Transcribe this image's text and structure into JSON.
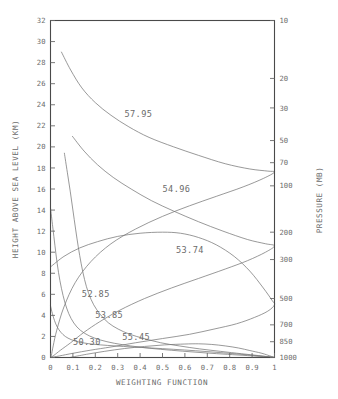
{
  "chart_data": {
    "type": "line",
    "title": "",
    "xlabel": "WEIGHTING FUNCTION",
    "ylabel": "HEIGHT ABOVE SEA LEVEL (KM)",
    "ylabel_right": "PRESSURE (MB)",
    "xlim": [
      0,
      1
    ],
    "ylim": [
      0,
      32
    ],
    "grid": false,
    "legend": "inline-curve-labels",
    "xticks": [
      0,
      0.1,
      0.2,
      0.3,
      0.4,
      0.5,
      0.6,
      0.7,
      0.8,
      0.9,
      1
    ],
    "xticklabels": [
      "0",
      "0.1",
      "0.2",
      "0.3",
      "0.4",
      "0.5",
      "0.6",
      "0.7",
      "0.8",
      "0.9",
      "1"
    ],
    "yticks": [
      0,
      2,
      4,
      6,
      8,
      10,
      12,
      14,
      16,
      18,
      20,
      22,
      24,
      26,
      28,
      30,
      32
    ],
    "yticklabels": [
      "0",
      "2",
      "4",
      "6",
      "8",
      "10",
      "12",
      "14",
      "16",
      "18",
      "20",
      "22",
      "24",
      "26",
      "28",
      "30",
      "32"
    ],
    "right_axis_scale": "log-pressure",
    "right_ticks": [
      {
        "label": "10",
        "km": 32.0
      },
      {
        "label": "20",
        "km": 26.5
      },
      {
        "label": "30",
        "km": 23.7
      },
      {
        "label": "50",
        "km": 20.6
      },
      {
        "label": "70",
        "km": 18.5
      },
      {
        "label": "100",
        "km": 16.3
      },
      {
        "label": "200",
        "km": 11.9
      },
      {
        "label": "300",
        "km": 9.3
      },
      {
        "label": "500",
        "km": 5.6
      },
      {
        "label": "700",
        "km": 3.1
      },
      {
        "label": "850",
        "km": 1.5
      },
      {
        "label": "1000",
        "km": 0.0
      }
    ],
    "series": [
      {
        "name": "57.95",
        "label": "57.95",
        "label_x": 0.33,
        "label_km": 23.1,
        "peak_km": 17.6,
        "points": [
          [
            0.049,
            29.0
          ],
          [
            0.09,
            27.3
          ],
          [
            0.14,
            25.6
          ],
          [
            0.2,
            24.2
          ],
          [
            0.27,
            23.0
          ],
          [
            0.35,
            21.9
          ],
          [
            0.44,
            20.9
          ],
          [
            0.55,
            20.0
          ],
          [
            0.66,
            19.2
          ],
          [
            0.78,
            18.4
          ],
          [
            0.89,
            17.9
          ],
          [
            0.97,
            17.7
          ],
          [
            1.0,
            17.6
          ],
          [
            0.95,
            17.0
          ],
          [
            0.86,
            16.2
          ],
          [
            0.74,
            15.3
          ],
          [
            0.62,
            14.4
          ],
          [
            0.5,
            13.4
          ],
          [
            0.38,
            12.2
          ],
          [
            0.27,
            10.8
          ],
          [
            0.18,
            9.1
          ],
          [
            0.11,
            7.1
          ],
          [
            0.06,
            4.8
          ],
          [
            0.028,
            2.6
          ],
          [
            0.012,
            1.1
          ],
          [
            0.004,
            0.2
          ],
          [
            0.0,
            0.0
          ]
        ]
      },
      {
        "name": "54.96",
        "label": "54.96",
        "label_x": 0.5,
        "label_km": 16.0,
        "peak_km": 10.6,
        "points": [
          [
            0.098,
            21.0
          ],
          [
            0.15,
            19.6
          ],
          [
            0.21,
            18.3
          ],
          [
            0.28,
            17.1
          ],
          [
            0.36,
            16.0
          ],
          [
            0.45,
            14.9
          ],
          [
            0.55,
            13.9
          ],
          [
            0.66,
            12.9
          ],
          [
            0.77,
            12.0
          ],
          [
            0.88,
            11.2
          ],
          [
            0.96,
            10.8
          ],
          [
            1.0,
            10.6
          ],
          [
            0.96,
            10.0
          ],
          [
            0.88,
            9.2
          ],
          [
            0.78,
            8.4
          ],
          [
            0.66,
            7.5
          ],
          [
            0.54,
            6.6
          ],
          [
            0.42,
            5.6
          ],
          [
            0.31,
            4.5
          ],
          [
            0.22,
            3.4
          ],
          [
            0.15,
            2.4
          ],
          [
            0.09,
            1.4
          ],
          [
            0.045,
            0.7
          ],
          [
            0.015,
            0.2
          ],
          [
            0.0,
            0.0
          ]
        ]
      },
      {
        "name": "53.74",
        "label": "53.74",
        "label_x": 0.56,
        "label_km": 10.2,
        "peak_km": 5.0,
        "points": [
          [
            0.0,
            8.6
          ],
          [
            0.06,
            9.6
          ],
          [
            0.13,
            10.4
          ],
          [
            0.21,
            11.0
          ],
          [
            0.3,
            11.5
          ],
          [
            0.4,
            11.8
          ],
          [
            0.5,
            11.9
          ],
          [
            0.58,
            11.8
          ],
          [
            0.66,
            11.4
          ],
          [
            0.74,
            10.7
          ],
          [
            0.82,
            9.6
          ],
          [
            0.89,
            8.2
          ],
          [
            0.95,
            6.6
          ],
          [
            0.99,
            5.4
          ],
          [
            1.0,
            5.0
          ],
          [
            0.97,
            4.4
          ],
          [
            0.91,
            3.8
          ],
          [
            0.83,
            3.2
          ],
          [
            0.73,
            2.7
          ],
          [
            0.62,
            2.2
          ],
          [
            0.5,
            1.8
          ],
          [
            0.38,
            1.4
          ],
          [
            0.27,
            1.0
          ],
          [
            0.18,
            0.7
          ],
          [
            0.1,
            0.4
          ],
          [
            0.04,
            0.15
          ],
          [
            0.0,
            0.0
          ]
        ]
      },
      {
        "name": "52.85",
        "label": "52.85",
        "label_x": 0.14,
        "label_km": 6.0,
        "peak_km": 0.0,
        "points": [
          [
            0.062,
            19.4
          ],
          [
            0.075,
            17.6
          ],
          [
            0.088,
            15.8
          ],
          [
            0.1,
            14.0
          ],
          [
            0.112,
            12.2
          ],
          [
            0.124,
            10.5
          ],
          [
            0.137,
            8.9
          ],
          [
            0.152,
            7.4
          ],
          [
            0.17,
            6.1
          ],
          [
            0.193,
            5.0
          ],
          [
            0.222,
            4.1
          ],
          [
            0.258,
            3.3
          ],
          [
            0.302,
            2.7
          ],
          [
            0.355,
            2.2
          ],
          [
            0.418,
            1.8
          ],
          [
            0.492,
            1.4
          ],
          [
            0.575,
            1.1
          ],
          [
            0.665,
            0.82
          ],
          [
            0.76,
            0.58
          ],
          [
            0.852,
            0.36
          ],
          [
            0.93,
            0.18
          ],
          [
            0.98,
            0.06
          ],
          [
            1.0,
            0.0
          ]
        ]
      },
      {
        "name": "53.85",
        "label": "53.85",
        "label_x": 0.2,
        "label_km": 4.0,
        "peak_km": 0.0,
        "points": [
          [
            0.0,
            14.2
          ],
          [
            0.01,
            12.4
          ],
          [
            0.02,
            10.6
          ],
          [
            0.03,
            8.9
          ],
          [
            0.042,
            7.3
          ],
          [
            0.056,
            5.9
          ],
          [
            0.072,
            4.7
          ],
          [
            0.092,
            3.7
          ],
          [
            0.118,
            2.9
          ],
          [
            0.152,
            2.3
          ],
          [
            0.196,
            1.85
          ],
          [
            0.252,
            1.5
          ],
          [
            0.32,
            1.22
          ],
          [
            0.4,
            0.98
          ],
          [
            0.49,
            0.78
          ],
          [
            0.59,
            0.6
          ],
          [
            0.69,
            0.44
          ],
          [
            0.79,
            0.3
          ],
          [
            0.88,
            0.18
          ],
          [
            0.95,
            0.08
          ],
          [
            1.0,
            0.0
          ]
        ]
      },
      {
        "name": "55.45",
        "label": "55.45",
        "label_x": 0.32,
        "label_km": 1.9,
        "peak_km": 0.0,
        "points": [
          [
            0.086,
            0.0
          ],
          [
            0.16,
            0.3
          ],
          [
            0.24,
            0.58
          ],
          [
            0.33,
            0.85
          ],
          [
            0.42,
            1.05
          ],
          [
            0.51,
            1.2
          ],
          [
            0.6,
            1.28
          ],
          [
            0.66,
            1.3
          ],
          [
            0.72,
            1.24
          ],
          [
            0.78,
            1.1
          ],
          [
            0.84,
            0.9
          ],
          [
            0.89,
            0.66
          ],
          [
            0.94,
            0.42
          ],
          [
            0.97,
            0.22
          ],
          [
            1.0,
            0.0
          ]
        ]
      },
      {
        "name": "50.30",
        "label": "50.30",
        "label_x": 0.1,
        "label_km": 1.45,
        "peak_km": 0.0,
        "points": [
          [
            0.0,
            4.9
          ],
          [
            0.008,
            4.2
          ],
          [
            0.018,
            3.5
          ],
          [
            0.03,
            2.9
          ],
          [
            0.046,
            2.4
          ],
          [
            0.066,
            2.0
          ],
          [
            0.092,
            1.7
          ],
          [
            0.125,
            1.48
          ],
          [
            0.168,
            1.32
          ],
          [
            0.222,
            1.2
          ],
          [
            0.288,
            1.1
          ],
          [
            0.365,
            1.0
          ],
          [
            0.452,
            0.9
          ],
          [
            0.548,
            0.78
          ],
          [
            0.648,
            0.64
          ],
          [
            0.748,
            0.48
          ],
          [
            0.842,
            0.32
          ],
          [
            0.922,
            0.17
          ],
          [
            0.975,
            0.06
          ],
          [
            1.0,
            0.0
          ]
        ]
      }
    ]
  }
}
